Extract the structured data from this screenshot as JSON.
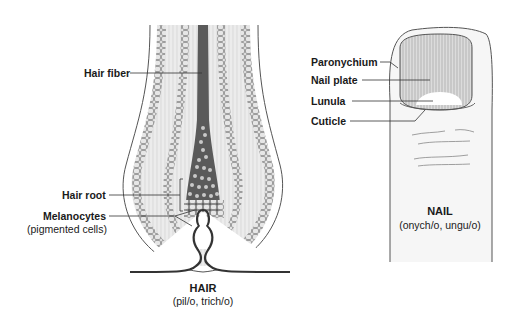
{
  "hair": {
    "title": "HAIR",
    "subtitle": "(pil/o, trich/o)",
    "labels": {
      "hair_fiber": "Hair fiber",
      "hair_root": "Hair root",
      "melanocytes": "Melanocytes",
      "melanocytes_note": "(pigmented cells)"
    }
  },
  "nail": {
    "title": "NAIL",
    "subtitle": "(onych/o, ungu/o)",
    "labels": {
      "paronychium": "Paronychium",
      "nail_plate": "Nail plate",
      "lunula": "Lunula",
      "cuticle": "Cuticle"
    }
  },
  "colors": {
    "line": "#333333",
    "hair_shaft": "#555555",
    "sheath": "#d9d9d9",
    "cell": "#bdbdbd",
    "background": "#ffffff"
  }
}
